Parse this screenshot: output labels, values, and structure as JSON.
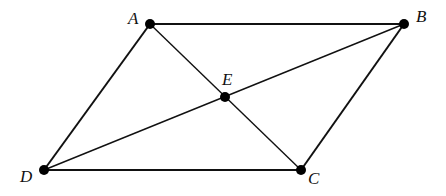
{
  "diagram": {
    "type": "parallelogram-with-diagonals",
    "points": {
      "A": {
        "label": "A",
        "x": 150,
        "y": 24
      },
      "B": {
        "label": "B",
        "x": 404,
        "y": 24
      },
      "C": {
        "label": "C",
        "x": 301,
        "y": 170
      },
      "D": {
        "label": "D",
        "x": 44,
        "y": 170
      },
      "E": {
        "label": "E",
        "x": 225,
        "y": 97
      }
    },
    "sides": [
      "AB",
      "BC",
      "CD",
      "DA"
    ],
    "diagonals": [
      "AC",
      "BD"
    ],
    "intersection": "E",
    "colors": {
      "stroke": "#111111",
      "point": "#000000",
      "background": "#ffffff"
    }
  }
}
